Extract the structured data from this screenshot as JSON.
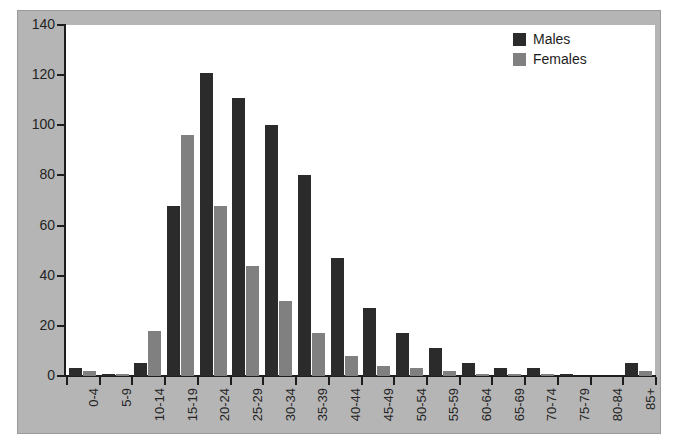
{
  "chart_data": {
    "type": "bar",
    "title": "",
    "subtitle": "",
    "xlabel": "",
    "ylabel": "",
    "ylim": [
      0,
      140
    ],
    "ytick_values": [
      0,
      20,
      40,
      60,
      80,
      100,
      120,
      140
    ],
    "ytick_labels": [
      "0",
      "20",
      "40",
      "60",
      "80",
      "100",
      "120",
      "140"
    ],
    "grid": false,
    "legend_position": "top-right",
    "categories": [
      "0-4",
      "5-9",
      "10-14",
      "15-19",
      "20-24",
      "25-29",
      "30-34",
      "35-39",
      "40-44",
      "45-49",
      "50-54",
      "55-59",
      "60-64",
      "65-69",
      "70-74",
      "75-79",
      "80-84",
      "85+"
    ],
    "series": [
      {
        "name": "Males",
        "color": "#2b2b2b",
        "values": [
          3,
          1,
          5,
          68,
          121,
          111,
          100,
          80,
          47,
          27,
          17,
          11,
          5,
          3,
          3,
          1,
          0,
          5
        ]
      },
      {
        "name": "Females",
        "color": "#808080",
        "values": [
          2,
          1,
          18,
          96,
          68,
          44,
          30,
          17,
          8,
          4,
          3,
          2,
          1,
          1,
          1,
          0,
          0,
          2
        ]
      }
    ]
  },
  "legend": {
    "items": [
      {
        "label": "Males",
        "color": "#2b2b2b"
      },
      {
        "label": "Females",
        "color": "#808080"
      }
    ]
  },
  "colors": {
    "males": "#2b2b2b",
    "females": "#808080",
    "panel_background": "#b5b5b5",
    "plot_background": "#ffffff",
    "axis": "#1d1d1d"
  }
}
